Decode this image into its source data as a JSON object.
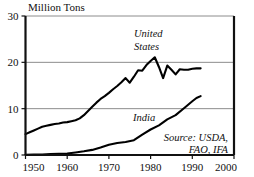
{
  "chart_data": {
    "type": "line",
    "title": "Million Tons",
    "xlabel": "",
    "ylabel": "Million Tons",
    "xlim": [
      1950,
      2000
    ],
    "ylim": [
      0,
      30
    ],
    "xticks": [
      "1950",
      "1960",
      "1970",
      "1980",
      "1990",
      "2000"
    ],
    "yticks": [
      "0",
      "10",
      "20",
      "30"
    ],
    "grid": "horizontal",
    "legend_position": "inline-annotations",
    "annotations": {
      "source": "Source: USDA,",
      "source_line2": "FAO, IFA",
      "series_label_us_line1": "United",
      "series_label_us_line2": "States",
      "series_label_india": "India"
    },
    "series": [
      {
        "name": "United States",
        "x": [
          1950,
          1951,
          1952,
          1953,
          1954,
          1955,
          1956,
          1957,
          1958,
          1959,
          1960,
          1961,
          1962,
          1963,
          1964,
          1965,
          1966,
          1967,
          1968,
          1969,
          1970,
          1971,
          1972,
          1973,
          1974,
          1975,
          1976,
          1977,
          1978,
          1979,
          1980,
          1981,
          1982,
          1983,
          1984,
          1985,
          1986,
          1987,
          1988,
          1989,
          1990,
          1991,
          1992
        ],
        "values": [
          4.5,
          4.9,
          5.3,
          5.7,
          6.1,
          6.3,
          6.5,
          6.7,
          6.8,
          7.0,
          7.1,
          7.3,
          7.5,
          7.9,
          8.6,
          9.5,
          10.4,
          11.3,
          12.1,
          12.7,
          13.4,
          14.2,
          14.9,
          15.7,
          16.6,
          15.6,
          16.9,
          18.3,
          18.2,
          19.4,
          20.3,
          21.1,
          19.0,
          16.6,
          19.3,
          18.4,
          17.4,
          18.5,
          18.4,
          18.4,
          18.6,
          18.7,
          18.7
        ]
      },
      {
        "name": "India",
        "x": [
          1950,
          1952,
          1954,
          1956,
          1958,
          1960,
          1962,
          1964,
          1966,
          1968,
          1970,
          1972,
          1974,
          1976,
          1978,
          1980,
          1982,
          1984,
          1986,
          1988,
          1990,
          1991,
          1992
        ],
        "values": [
          0.05,
          0.08,
          0.12,
          0.18,
          0.25,
          0.33,
          0.55,
          0.8,
          1.1,
          1.6,
          2.2,
          2.6,
          2.8,
          3.2,
          4.4,
          5.5,
          6.4,
          7.7,
          8.6,
          10.1,
          11.6,
          12.3,
          12.7
        ]
      }
    ],
    "colors": {
      "line": "#000000",
      "grid": "#8c8c8c",
      "axis": "#111111",
      "background": "#ffffff"
    }
  }
}
